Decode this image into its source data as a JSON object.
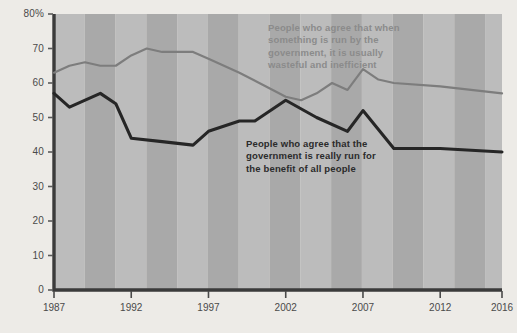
{
  "chart_data": {
    "type": "line",
    "title": "",
    "subtitle": "",
    "xlabel": "",
    "ylabel": "",
    "xlim": [
      1987,
      2016
    ],
    "ylim": [
      0,
      80
    ],
    "grid": false,
    "legend_position": "inline-annotations",
    "background": "#edebe7",
    "plot_band_colors": [
      "#bcbcbc",
      "#a9a9a9"
    ],
    "x_ticks": [
      "1987",
      "1992",
      "1997",
      "2002",
      "2007",
      "2012",
      "2016"
    ],
    "y_ticks": [
      "80%",
      "70",
      "60",
      "50",
      "40",
      "30",
      "20",
      "10",
      "0"
    ],
    "series": [
      {
        "name": "People who agree that when something is run by the government, it is usually wasteful and inefficient",
        "color": "#7d7d7d",
        "label_text": "People who agree that when\nsomething is run by the\ngovernment, it is usually\nwasteful and inefficient",
        "points": [
          {
            "x": 1987,
            "y": 63
          },
          {
            "x": 1988,
            "y": 65
          },
          {
            "x": 1989,
            "y": 66
          },
          {
            "x": 1990,
            "y": 65
          },
          {
            "x": 1991,
            "y": 65
          },
          {
            "x": 1992,
            "y": 68
          },
          {
            "x": 1993,
            "y": 70
          },
          {
            "x": 1994,
            "y": 69
          },
          {
            "x": 1995,
            "y": 69
          },
          {
            "x": 1996,
            "y": 69
          },
          {
            "x": 1997,
            "y": 67
          },
          {
            "x": 1999,
            "y": 63
          },
          {
            "x": 2002,
            "y": 56
          },
          {
            "x": 2003,
            "y": 55
          },
          {
            "x": 2004,
            "y": 57
          },
          {
            "x": 2005,
            "y": 60
          },
          {
            "x": 2006,
            "y": 58
          },
          {
            "x": 2007,
            "y": 64
          },
          {
            "x": 2008,
            "y": 61
          },
          {
            "x": 2009,
            "y": 60
          },
          {
            "x": 2012,
            "y": 59
          },
          {
            "x": 2014,
            "y": 58
          },
          {
            "x": 2016,
            "y": 57
          }
        ]
      },
      {
        "name": "People who agree that the government is really run for the benefit of all people",
        "color": "#262626",
        "label_text": "People who agree that the\ngovernment is really run for\nthe benefit of all people",
        "points": [
          {
            "x": 1987,
            "y": 57
          },
          {
            "x": 1988,
            "y": 53
          },
          {
            "x": 1990,
            "y": 57
          },
          {
            "x": 1991,
            "y": 54
          },
          {
            "x": 1992,
            "y": 44
          },
          {
            "x": 1994,
            "y": 43
          },
          {
            "x": 1996,
            "y": 42
          },
          {
            "x": 1997,
            "y": 46
          },
          {
            "x": 1999,
            "y": 49
          },
          {
            "x": 2000,
            "y": 49
          },
          {
            "x": 2002,
            "y": 55
          },
          {
            "x": 2004,
            "y": 50
          },
          {
            "x": 2006,
            "y": 46
          },
          {
            "x": 2007,
            "y": 52
          },
          {
            "x": 2009,
            "y": 41
          },
          {
            "x": 2012,
            "y": 41
          },
          {
            "x": 2016,
            "y": 40
          }
        ]
      }
    ]
  }
}
